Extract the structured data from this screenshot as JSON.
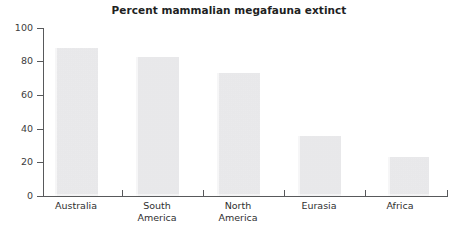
{
  "chart_data": {
    "type": "bar",
    "title": "Percent mammalian megafauna extinct",
    "xlabel": "",
    "ylabel": "",
    "categories": [
      "Australia",
      "South\nAmerica",
      "North\nAmerica",
      "Eurasia",
      "Africa"
    ],
    "values": [
      88,
      83,
      73,
      36,
      23
    ],
    "ylim": [
      0,
      100
    ],
    "yticks": [
      0,
      20,
      40,
      60,
      80,
      100
    ],
    "ytick_labels": [
      "0",
      "20",
      "40",
      "60",
      "80",
      "100"
    ],
    "grid": false,
    "legend": null,
    "bar_color": "#eeeef0",
    "axis_color": "#58595b",
    "text_color": "#221f1f"
  }
}
